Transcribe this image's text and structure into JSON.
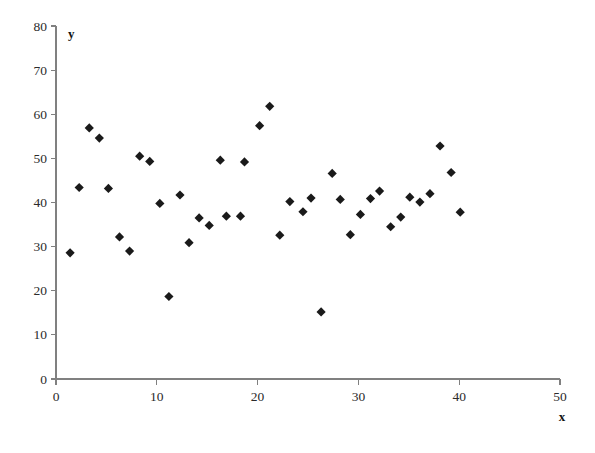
{
  "chart_data": {
    "type": "scatter",
    "title": "",
    "xlabel": "x",
    "ylabel": "y",
    "xlim": [
      0,
      50
    ],
    "ylim": [
      0,
      80
    ],
    "xticks": [
      0,
      10,
      20,
      30,
      40,
      50
    ],
    "yticks": [
      0,
      10,
      20,
      30,
      40,
      50,
      60,
      70,
      80
    ],
    "xtick_labels": [
      "0",
      "10",
      "20",
      "30",
      "40",
      "50"
    ],
    "ytick_labels": [
      "0",
      "10",
      "20",
      "30",
      "40",
      "50",
      "60",
      "70",
      "80"
    ],
    "grid": false,
    "legend": null,
    "marker": "diamond",
    "marker_color": "#1a1a1a",
    "marker_size": 7,
    "series": [
      {
        "name": "data",
        "points": [
          [
            1.4,
            28.6
          ],
          [
            2.3,
            43.4
          ],
          [
            3.3,
            56.9
          ],
          [
            4.3,
            54.6
          ],
          [
            5.2,
            43.2
          ],
          [
            6.3,
            32.2
          ],
          [
            7.3,
            29.0
          ],
          [
            8.3,
            50.5
          ],
          [
            9.3,
            49.3
          ],
          [
            10.3,
            39.8
          ],
          [
            11.2,
            18.7
          ],
          [
            12.3,
            41.7
          ],
          [
            13.2,
            30.9
          ],
          [
            14.2,
            36.5
          ],
          [
            15.2,
            34.8
          ],
          [
            16.3,
            49.6
          ],
          [
            16.9,
            36.9
          ],
          [
            18.3,
            36.9
          ],
          [
            18.7,
            49.2
          ],
          [
            20.2,
            57.4
          ],
          [
            21.2,
            61.8
          ],
          [
            22.2,
            32.6
          ],
          [
            23.2,
            40.2
          ],
          [
            24.5,
            37.9
          ],
          [
            25.3,
            41.0
          ],
          [
            26.3,
            15.2
          ],
          [
            27.4,
            46.6
          ],
          [
            28.2,
            40.7
          ],
          [
            29.2,
            32.7
          ],
          [
            30.2,
            37.3
          ],
          [
            31.2,
            40.9
          ],
          [
            32.1,
            42.6
          ],
          [
            33.2,
            34.5
          ],
          [
            34.2,
            36.7
          ],
          [
            35.1,
            41.2
          ],
          [
            36.1,
            40.1
          ],
          [
            37.1,
            42.0
          ],
          [
            38.1,
            52.8
          ],
          [
            39.2,
            46.8
          ],
          [
            40.1,
            37.8
          ]
        ]
      }
    ]
  },
  "layout": {
    "plot_left_px": 56,
    "plot_right_px": 560,
    "plot_bottom_px": 379,
    "plot_top_px": 26
  }
}
